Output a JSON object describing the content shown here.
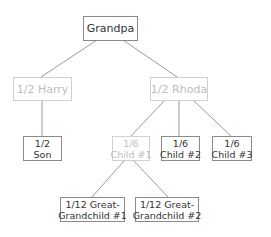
{
  "diagram": {
    "type": "family-tree",
    "colors": {
      "line": "#9a9a9a",
      "border": "#8a8a8a",
      "text": "#333333",
      "faded_text": "#bdbdbd",
      "faded_border": "#d0d0d0"
    },
    "nodes": {
      "grandpa": {
        "lines": [
          "Grandpa"
        ],
        "faded": false
      },
      "harry": {
        "lines": [
          "1/2 Harry"
        ],
        "faded": true
      },
      "rhoda": {
        "lines": [
          "1/2 Rhoda"
        ],
        "faded": true
      },
      "son": {
        "lines": [
          "1/2",
          "Son"
        ],
        "faded": false
      },
      "child1": {
        "lines": [
          "1/6",
          "Child #1"
        ],
        "faded": true
      },
      "child2": {
        "lines": [
          "1/6",
          "Child #2"
        ],
        "faded": false
      },
      "child3": {
        "lines": [
          "1/6",
          "Child #3"
        ],
        "faded": false
      },
      "ggc1": {
        "lines": [
          "1/12 Great-",
          "Grandchild #1"
        ],
        "faded": false
      },
      "ggc2": {
        "lines": [
          "1/12 Great-",
          "Grandchild #2"
        ],
        "faded": false
      }
    },
    "edges": [
      [
        "grandpa",
        "harry"
      ],
      [
        "grandpa",
        "rhoda"
      ],
      [
        "harry",
        "son"
      ],
      [
        "rhoda",
        "child1"
      ],
      [
        "rhoda",
        "child2"
      ],
      [
        "rhoda",
        "child3"
      ],
      [
        "child1",
        "ggc1"
      ],
      [
        "child1",
        "ggc2"
      ]
    ]
  }
}
